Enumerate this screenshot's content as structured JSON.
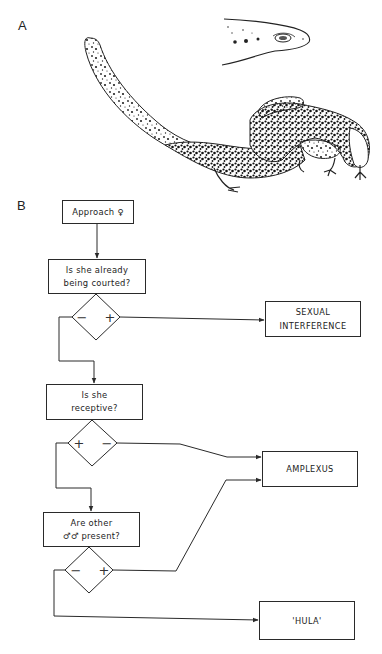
{
  "panels": {
    "a_label": "A",
    "b_label": "B"
  },
  "illustration": {
    "subject": "salamander-amplexus-illustration",
    "inset": "salamander-head-detail"
  },
  "flowchart": {
    "start": {
      "label": "Approach ♀"
    },
    "q1": {
      "line1": "Is she already",
      "line2": "being courted?",
      "neg": "−",
      "pos": "+"
    },
    "q2": {
      "line1": "Is she",
      "line2": "receptive?",
      "pos": "+",
      "neg": "−"
    },
    "q3": {
      "line1": "Are other",
      "line2": "♂♂ present?",
      "neg": "−",
      "pos": "+"
    },
    "outcomes": {
      "sexual_interference": {
        "line1": "SEXUAL",
        "line2": "INTERFERENCE"
      },
      "amplexus": {
        "label": "AMPLEXUS"
      },
      "hula": {
        "label": "'HULA'"
      }
    },
    "colors": {
      "stroke": "#2a2a2a",
      "ink": "#1a1a1a"
    }
  }
}
